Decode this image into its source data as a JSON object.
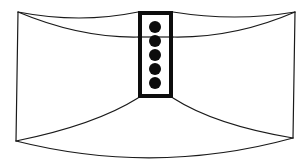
{
  "diagram": {
    "title": "",
    "description": "Line drawing of a curved wide panel with a central vertical rectangular element containing five dots",
    "colors": {
      "background": "#ffffff",
      "stroke": "#1a1a1a",
      "fill_dark": "#0d0d0d",
      "rect_inner": "#ffffff"
    },
    "outer_shape": {
      "top_left": [
        18,
        12
      ],
      "top_right": [
        295,
        12
      ],
      "bottom_left": [
        16,
        141
      ],
      "bottom_right": [
        293,
        138
      ],
      "bottom_curve_low_y": 158
    },
    "center_rect": {
      "x": 138,
      "y": 11,
      "width": 35,
      "height": 87,
      "border": 4
    },
    "dots": [
      {
        "cx": 155,
        "cy": 27,
        "r": 6
      },
      {
        "cx": 155,
        "cy": 41,
        "r": 6
      },
      {
        "cx": 155,
        "cy": 55,
        "r": 6
      },
      {
        "cx": 155,
        "cy": 69,
        "r": 6
      },
      {
        "cx": 155,
        "cy": 83,
        "r": 6
      }
    ],
    "dot_count": 5
  }
}
